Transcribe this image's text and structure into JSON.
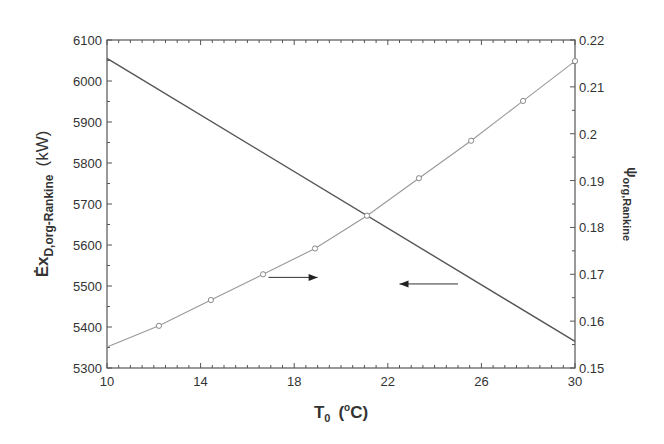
{
  "chart_data": {
    "type": "line",
    "title": "",
    "xlabel": "T0 (°C)",
    "xlabel_main": "T",
    "xlabel_sub": "0",
    "xlabel_unit_open": "(",
    "xlabel_unit_sup": "o",
    "xlabel_unit_rest": "C)",
    "ylabel_left": "Ėx D,org-Rankine (kW)",
    "ylabel_left_main": "Ėx",
    "ylabel_left_sub": "D,org-Rankine",
    "ylabel_left_unit": "(kW)",
    "ylabel_right": "ψ org,Rankine",
    "ylabel_right_main": "ψ",
    "ylabel_right_sub": "org,Rankine",
    "xlim": [
      10,
      30
    ],
    "ylim_left": [
      5300,
      6100
    ],
    "ylim_right": [
      0.15,
      0.22
    ],
    "x_ticks": [
      "10",
      "14",
      "18",
      "22",
      "26",
      "30"
    ],
    "y_left_ticks": [
      "5300",
      "5400",
      "5500",
      "5600",
      "5700",
      "5800",
      "5900",
      "6000",
      "6100"
    ],
    "y_right_ticks": [
      "0.15",
      "0.16",
      "0.17",
      "0.18",
      "0.19",
      "0.2",
      "0.21",
      "0.22"
    ],
    "grid": false,
    "legend": null,
    "series": [
      {
        "name": "Ėx D,org-Rankine",
        "axis": "left",
        "style": "solid dark line, no markers",
        "color": "#555555",
        "x": [
          10,
          30
        ],
        "values": [
          6055,
          5365
        ]
      },
      {
        "name": "ψ org,Rankine",
        "axis": "right",
        "style": "light line with open circle markers",
        "color": "#999999",
        "x": [
          10,
          12.22,
          14.44,
          16.67,
          18.89,
          21.11,
          23.33,
          25.56,
          27.78,
          30
        ],
        "values": [
          0.1545,
          0.159,
          0.1645,
          0.17,
          0.1755,
          0.1825,
          0.1905,
          0.1985,
          0.207,
          0.2155
        ]
      }
    ],
    "annotations": [
      {
        "type": "arrow",
        "direction": "right",
        "points_to": "right axis (ψ series)",
        "from_x": 16.9,
        "to_x": 19.0,
        "y_left": 5521
      },
      {
        "type": "arrow",
        "direction": "left",
        "points_to": "left axis (Ėx series)",
        "from_x": 25.0,
        "to_x": 22.5,
        "y_left": 5505
      }
    ]
  }
}
